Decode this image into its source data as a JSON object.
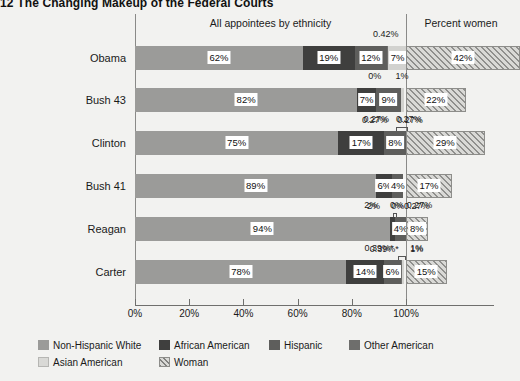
{
  "title": {
    "number": "12",
    "text": "The Changing Makeup of the Federal Courts"
  },
  "headers": {
    "ethnicity": "All appointees by ethnicity",
    "women": "Percent women"
  },
  "axis": {
    "ticks": [
      "0%",
      "20%",
      "40%",
      "60%",
      "80%",
      "100%"
    ],
    "tick_values": [
      0,
      20,
      40,
      60,
      80,
      100
    ]
  },
  "legend": [
    {
      "label": "Non-Hispanic White",
      "key": "white",
      "color": "#9b9b99"
    },
    {
      "label": "African American",
      "key": "african",
      "color": "#3f3f3e"
    },
    {
      "label": "Hispanic",
      "key": "hispanic",
      "color": "#5e5e5c"
    },
    {
      "label": "Other American",
      "key": "other",
      "color": "#6e6e6c"
    },
    {
      "label": "Asian American",
      "key": "asian",
      "color": "#d9d9d6"
    },
    {
      "label": "Woman",
      "key": "woman",
      "color": "#d9d9d6"
    }
  ],
  "chart_data": {
    "type": "bar",
    "orientation": "horizontal",
    "stacked": true,
    "title": "The Changing Makeup of the Federal Courts",
    "xlabel": "",
    "ylabel": "",
    "xlim": [
      0,
      100
    ],
    "grid": false,
    "legend_position": "bottom-left",
    "categories": [
      "Obama",
      "Bush 43",
      "Clinton",
      "Bush 41",
      "Reagan",
      "Carter"
    ],
    "series": [
      {
        "name": "Non-Hispanic White",
        "values": [
          62,
          82,
          75,
          89,
          94,
          78
        ]
      },
      {
        "name": "African American",
        "values": [
          19,
          7,
          17,
          6,
          2,
          14
        ]
      },
      {
        "name": "Hispanic",
        "values": [
          12,
          9,
          8,
          4,
          4,
          6
        ]
      },
      {
        "name": "Other American",
        "values": [
          0.42,
          0.27,
          0.27,
          0.27,
          0.27,
          0.39
        ]
      },
      {
        "name": "Asian American",
        "values": [
          7,
          1,
          0.27,
          0,
          0,
          1
        ]
      },
      {
        "name": "Woman",
        "values": [
          42,
          22,
          29,
          17,
          8,
          15
        ]
      }
    ],
    "rows": [
      {
        "name": "Obama",
        "segments": [
          {
            "key": "white",
            "value": 62,
            "label": "62%",
            "inbar": true
          },
          {
            "key": "african",
            "value": 19,
            "label": "19%",
            "inbar": true
          },
          {
            "key": "hispanic",
            "value": 12,
            "label": "12%",
            "inbar": true
          },
          {
            "key": "other",
            "value": 0.42,
            "label": "0.42%",
            "inbar": false,
            "side": "above"
          },
          {
            "key": "asian",
            "value": 7,
            "label": "7%",
            "inbar": true
          }
        ],
        "woman": {
          "value": 42,
          "label": "42%"
        }
      },
      {
        "name": "Bush 43",
        "segments": [
          {
            "key": "white",
            "value": 82,
            "label": "82%",
            "inbar": true
          },
          {
            "key": "african",
            "value": 7,
            "label": "7%",
            "inbar": true
          },
          {
            "key": "hispanic",
            "value": 9,
            "label": "9%",
            "inbar": true
          },
          {
            "key": "other",
            "value": 0.27,
            "label": "0.27%",
            "inbar": false,
            "side": "below"
          },
          {
            "key": "asian",
            "value": 1,
            "label": "1%",
            "inbar": false,
            "side": "above"
          }
        ],
        "extra_above": [
          {
            "label": "0%",
            "x": 88.5
          },
          {
            "label": "1%",
            "x": 98.5
          }
        ],
        "extra_below": [
          {
            "label": "0.27%",
            "x": 88.5
          },
          {
            "label": "0.27%",
            "x": 101.5
          }
        ],
        "woman": {
          "value": 22,
          "label": "22%"
        }
      },
      {
        "name": "Clinton",
        "segments": [
          {
            "key": "white",
            "value": 75,
            "label": "75%",
            "inbar": true
          },
          {
            "key": "african",
            "value": 17,
            "label": "17%",
            "inbar": true
          },
          {
            "key": "hispanic",
            "value": 8,
            "label": "8%",
            "inbar": true
          },
          {
            "key": "other",
            "value": 0.27,
            "label": "0.27%",
            "inbar": false,
            "side": "above"
          },
          {
            "key": "asian",
            "value": 0.27,
            "label": "0.27%",
            "inbar": false,
            "side": "above"
          }
        ],
        "woman": {
          "value": 29,
          "label": "29%"
        }
      },
      {
        "name": "Bush 41",
        "segments": [
          {
            "key": "white",
            "value": 89,
            "label": "89%",
            "inbar": true
          },
          {
            "key": "african",
            "value": 6,
            "label": "6%",
            "inbar": true
          },
          {
            "key": "hispanic",
            "value": 4,
            "label": "4%",
            "inbar": true
          },
          {
            "key": "other",
            "value": 0,
            "label": "0%",
            "inbar": false,
            "side": "above"
          },
          {
            "key": "asian",
            "value": 0,
            "label": "0%",
            "inbar": false,
            "side": "above"
          }
        ],
        "extra_below": [
          {
            "label": "2%",
            "x": 88.0
          },
          {
            "label": "0%",
            "x": 97.0
          },
          {
            "label": "0.27%",
            "x": 104.0
          }
        ],
        "woman": {
          "value": 17,
          "label": "17%"
        }
      },
      {
        "name": "Reagan",
        "segments": [
          {
            "key": "white",
            "value": 94,
            "label": "94%",
            "inbar": true
          },
          {
            "key": "african",
            "value": 2,
            "label": "2%",
            "inbar": false,
            "side": "above"
          },
          {
            "key": "hispanic",
            "value": 4,
            "label": "4%",
            "inbar": true
          },
          {
            "key": "other",
            "value": 0,
            "label": "0%",
            "inbar": false,
            "side": "above"
          },
          {
            "key": "asian",
            "value": 0.27,
            "label": "0.27%",
            "inbar": false,
            "side": "above"
          }
        ],
        "extra_below": [
          {
            "label": "0.39%*",
            "x": 92.0
          },
          {
            "label": "1%",
            "x": 104.0
          }
        ],
        "woman": {
          "value": 8,
          "label": "8%"
        }
      },
      {
        "name": "Carter",
        "segments": [
          {
            "key": "white",
            "value": 78,
            "label": "78%",
            "inbar": true
          },
          {
            "key": "african",
            "value": 14,
            "label": "14%",
            "inbar": true
          },
          {
            "key": "hispanic",
            "value": 6,
            "label": "6%",
            "inbar": true
          },
          {
            "key": "other",
            "value": 0.39,
            "label": "0.39%*",
            "inbar": false,
            "side": "above"
          },
          {
            "key": "asian",
            "value": 1,
            "label": "1%",
            "inbar": false,
            "side": "above"
          }
        ],
        "woman": {
          "value": 15,
          "label": "15%"
        }
      }
    ]
  }
}
